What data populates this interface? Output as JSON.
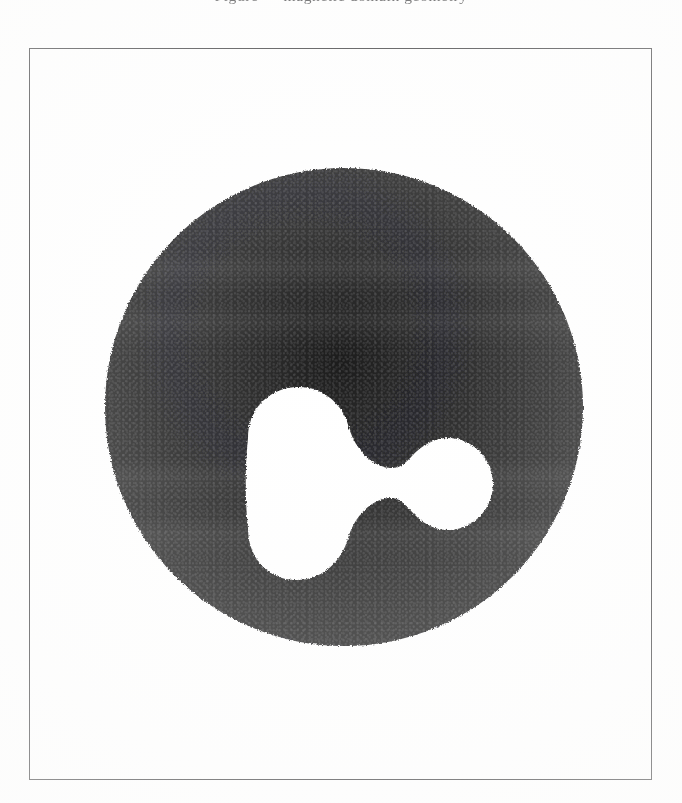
{
  "page": {
    "width": 682,
    "height": 803,
    "background_color": "#ffffff",
    "kind": "scanned-book-figure"
  },
  "caption": {
    "clipped_top_line": "Figure — magnetic domain geometry",
    "note": "only the descender tips of this line remain at the very top edge"
  },
  "frame": {
    "x": 29,
    "y": 48,
    "width": 623,
    "height": 732,
    "stroke_color": "#2b2b2d",
    "stroke_width": 1.6,
    "fill_color": "#ffffff"
  },
  "figure": {
    "disc": {
      "name": "dark-disc",
      "center_x": 343,
      "center_y": 406,
      "radius": 243,
      "fill_color": "#151516"
    },
    "void": {
      "name": "peanut-void",
      "shape": "peanut",
      "fill_color": "#ffffff",
      "left_lobe": {
        "center_x": 196,
        "center_y": 415,
        "radius_x": 54,
        "radius_y": 63
      },
      "right_lobe": {
        "center_x": 344,
        "center_y": 418,
        "radius_x": 46,
        "radius_y": 45
      },
      "waist_x": 285,
      "waist_height": 93,
      "bounds": {
        "x_min": 143,
        "x_max": 390,
        "y_min": 352,
        "y_max": 478
      }
    }
  },
  "texture": {
    "grain": "halftone",
    "bleed_through": "faint reverse-page ghosting in upper and lower disc"
  }
}
